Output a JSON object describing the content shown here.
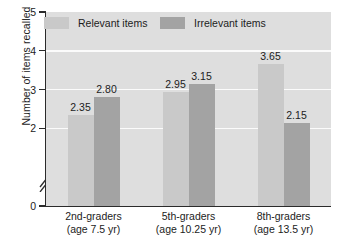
{
  "chart_data": {
    "type": "bar",
    "title": "",
    "subtitle": "",
    "xlabel": "",
    "ylabel": "Number of items recalled",
    "categories": [
      "2nd-graders\n(age 7.5 yr)",
      "5th-graders\n(age 10.25 yr)",
      "8th-graders\n(age 13.5 yr)"
    ],
    "category_lines": [
      {
        "line1": "2nd-graders",
        "line2": "(age 7.5 yr)"
      },
      {
        "line1": "5th-graders",
        "line2": "(age 10.25 yr)"
      },
      {
        "line1": "8th-graders",
        "line2": "(age 13.5 yr)"
      }
    ],
    "series": [
      {
        "name": "Relevant items",
        "color": "#c9c9c9",
        "values": [
          2.35,
          2.95,
          3.65
        ],
        "labels": [
          "2.35",
          "2.95",
          "3.65"
        ]
      },
      {
        "name": "Irrelevant items",
        "color": "#a3a3a3",
        "values": [
          2.8,
          3.15,
          2.15
        ],
        "labels": [
          "2.80",
          "3.15",
          "2.15"
        ]
      }
    ],
    "ylim": [
      0,
      5
    ],
    "yticks": [
      0,
      2,
      3,
      4,
      5
    ],
    "ytick_labels": [
      "0",
      "2",
      "3",
      "4",
      "5"
    ],
    "axis_break": {
      "present": true,
      "between": [
        0,
        2
      ]
    },
    "grid": {
      "horizontal": true,
      "color": "#fbfbfb"
    },
    "legend": {
      "position": "top-inside",
      "entries": [
        "Relevant items",
        "Irrelevant items"
      ]
    },
    "plot_background": "#dedede"
  }
}
